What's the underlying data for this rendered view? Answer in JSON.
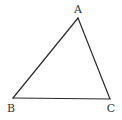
{
  "diagram": {
    "type": "triangle",
    "stroke_color": "#2a2a2a",
    "vertices": [
      {
        "name": "A",
        "x": 78,
        "y": 18,
        "label_x": 78,
        "label_y": 13
      },
      {
        "name": "B",
        "x": 13,
        "y": 98,
        "label_x": 11,
        "label_y": 111
      },
      {
        "name": "C",
        "x": 110,
        "y": 99,
        "label_x": 111,
        "label_y": 111
      }
    ],
    "labels": {
      "a": "A",
      "b": "B",
      "c": "C"
    },
    "edges": [
      {
        "from": "A",
        "to": "B"
      },
      {
        "from": "B",
        "to": "C"
      },
      {
        "from": "C",
        "to": "A"
      }
    ]
  }
}
